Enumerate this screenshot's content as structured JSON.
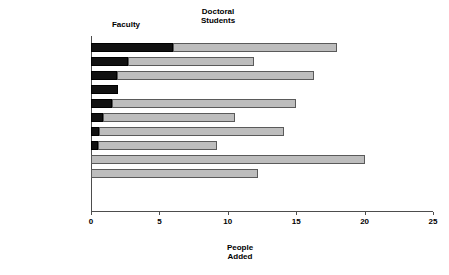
{
  "chart_data": {
    "type": "bar",
    "orientation": "horizontal",
    "stacked": true,
    "title": "",
    "xlabel": "People\nAdded",
    "ylabel": "",
    "xlim": [
      0,
      25
    ],
    "xticks": [
      0,
      5,
      10,
      15,
      20,
      25
    ],
    "xtick_labels": [
      "0",
      "5",
      "10",
      "15",
      "20",
      "25"
    ],
    "grid": false,
    "legend_position": "top-inline",
    "categories": [
      "Mathematics",
      "Physics",
      "Psychology",
      "Elec. Engr.",
      "Chemistry",
      "Computer Science",
      "Economics",
      "Civil Engr",
      "Biology",
      "Geosciences",
      "Mech. Engr.",
      "Chem. Engr"
    ],
    "series": [
      {
        "name": "Faculty",
        "color": "#111111",
        "values": [
          6.0,
          2.7,
          1.9,
          2.0,
          1.5,
          0.9,
          0.6,
          0.5,
          0.0,
          0.0,
          0.0,
          0.0
        ]
      },
      {
        "name": "Doctoral Students",
        "color": "#bdbdbd",
        "values": [
          12.0,
          9.2,
          14.4,
          0.0,
          13.5,
          9.6,
          13.5,
          8.7,
          20.0,
          12.2,
          0.0,
          0.0
        ]
      }
    ],
    "totals": [
      18.0,
      11.9,
      16.3,
      2.0,
      15.0,
      10.5,
      14.1,
      9.2,
      20.0,
      12.2,
      0.0,
      0.0
    ],
    "annotations": {
      "faculty_header": "Faculty",
      "doctoral_header": "Doctoral\nStudents"
    }
  },
  "axis": {
    "x_title": "People\nAdded"
  }
}
